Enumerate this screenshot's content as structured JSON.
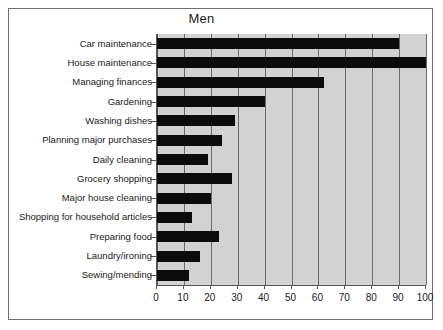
{
  "chart": {
    "title": "Men",
    "type": "bar"
  },
  "chart_data": {
    "type": "bar",
    "orientation": "horizontal",
    "title": "Men",
    "xlabel": "",
    "ylabel": "",
    "xlim": [
      0,
      100
    ],
    "xticks": [
      0,
      10,
      20,
      30,
      40,
      50,
      60,
      70,
      80,
      90,
      100
    ],
    "xtick_labels": [
      "0",
      "10",
      "20",
      "30",
      "40",
      "50",
      "60",
      "70",
      "80",
      "90",
      "100"
    ],
    "grid": true,
    "grid_axis": "x",
    "legend": false,
    "plot_background": "#d2d2d2",
    "bar_color": "#0b0b0b",
    "categories": [
      "Car maintenance",
      "House maintenance",
      "Managing finances",
      "Gardening",
      "Washing dishes",
      "Planning major purchases",
      "Daily cleaning",
      "Grocery shopping",
      "Major house cleaning",
      "Shopping for household articles",
      "Preparing food",
      "Laundry/ironing",
      "Sewing/mending"
    ],
    "values": [
      90,
      100,
      62,
      40,
      29,
      24,
      19,
      28,
      20,
      13,
      23,
      16,
      12
    ]
  }
}
